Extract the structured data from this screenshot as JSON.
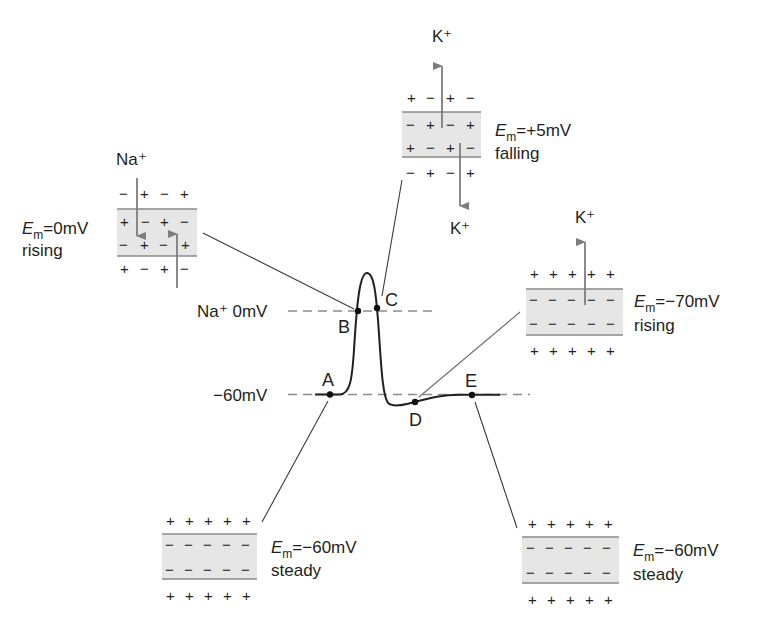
{
  "diagram": {
    "title": "",
    "levels": {
      "zero": "Na⁺ 0mV",
      "resting": "−60mV"
    },
    "points": {
      "A": "A",
      "B": "B",
      "C": "C",
      "D": "D",
      "E": "E"
    },
    "panels": {
      "rising_zero": {
        "ion": "Na⁺",
        "em_symbol": "E",
        "em_sub": "m",
        "em_value": "=0mV",
        "state": "rising",
        "outer": [
          "−",
          "+",
          "−",
          "+"
        ],
        "inner_top": [
          "+",
          "−",
          "+",
          "−"
        ],
        "inner_bottom": [
          "−",
          "+",
          "−",
          "+"
        ],
        "below": [
          "+",
          "−",
          "+",
          "−"
        ],
        "arrows": [
          "Na+ inward (down)",
          "arrow up"
        ]
      },
      "falling_peak": {
        "ion_top": "K⁺",
        "ion_bottom": "K⁺",
        "em_symbol": "E",
        "em_sub": "m",
        "em_value": "=+5mV",
        "state": "falling",
        "outer": [
          "+",
          "−",
          "+",
          "−"
        ],
        "inner_top": [
          "−",
          "+",
          "−",
          "+"
        ],
        "inner_bottom": [
          "+",
          "−",
          "+",
          "−"
        ],
        "below": [
          "−",
          "+",
          "−",
          "+"
        ]
      },
      "rising_hyper": {
        "ion": "K⁺",
        "em_symbol": "E",
        "em_sub": "m",
        "em_value": "=−70mV",
        "state": "rising",
        "outer": [
          "+",
          "+",
          "+",
          "+",
          "+"
        ],
        "inner_top": [
          "−",
          "−",
          "−",
          "−",
          "−"
        ],
        "inner_bottom": [
          "−",
          "−",
          "−",
          "−",
          "−"
        ],
        "below": [
          "+",
          "+",
          "+",
          "+",
          "+"
        ]
      },
      "steady_A": {
        "em_symbol": "E",
        "em_sub": "m",
        "em_value": "=−60mV",
        "state": "steady",
        "outer": [
          "+",
          "+",
          "+",
          "+",
          "+"
        ],
        "inner_top": [
          "−",
          "−",
          "−",
          "−",
          "−"
        ],
        "inner_bottom": [
          "−",
          "−",
          "−",
          "−",
          "−"
        ],
        "below": [
          "+",
          "+",
          "+",
          "+",
          "+"
        ]
      },
      "steady_E": {
        "em_symbol": "E",
        "em_sub": "m",
        "em_value": "=−60mV",
        "state": "steady",
        "outer": [
          "+",
          "+",
          "+",
          "+",
          "+"
        ],
        "inner_top": [
          "−",
          "−",
          "−",
          "−",
          "−"
        ],
        "inner_bottom": [
          "−",
          "−",
          "−",
          "−",
          "−"
        ],
        "below": [
          "+",
          "+",
          "+",
          "+",
          "+"
        ]
      }
    },
    "colors": {
      "membrane_fill": "#e6e6e6",
      "membrane_border": "#8a8a8a",
      "arrow": "#7d7d7d",
      "line": "#3a3a3a",
      "dash": "#8a8a8a",
      "text": "#231f20"
    }
  }
}
